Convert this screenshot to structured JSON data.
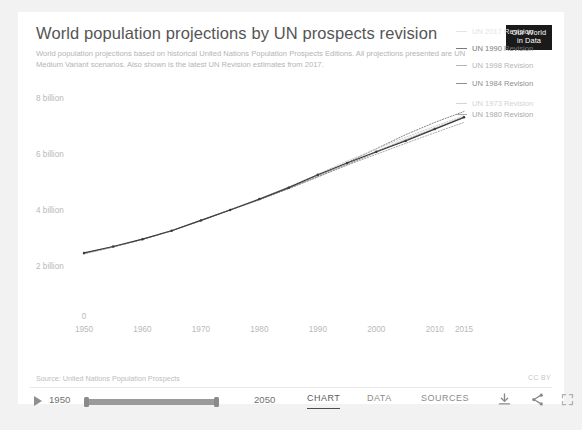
{
  "header": {
    "title": "World population projections by UN prospects revision",
    "subtitle": "World population projections based on historical United Nations Population Prospects Editions. All projections presented are UN Medium Variant scenarios. Also shown is the latest UN Revision estimates from 2017.",
    "logo_line1": "Our World",
    "logo_line2": "in Data"
  },
  "chart_data": {
    "type": "line",
    "title": "World population projections by UN prospects revision",
    "subtitle": "World population projections based on historical United Nations Population Prospects Editions. All projections presented are UN Medium Variant scenarios. Also shown is the latest UN Revision estimates from 2017.",
    "xlabel": "",
    "ylabel": "",
    "xlim": [
      1950,
      2015
    ],
    "ylim": [
      0,
      8
    ],
    "grid": false,
    "legend_position": "right",
    "y_ticks": [
      2,
      4,
      6,
      8
    ],
    "y_tick_labels": [
      "2 billion",
      "4 billion",
      "6 billion",
      "8 billion"
    ],
    "y_zero_label": "0",
    "x_ticks": [
      1950,
      1960,
      1970,
      1980,
      1990,
      2000,
      2010,
      2015
    ],
    "x_tick_labels": [
      "1950",
      "1960",
      "1970",
      "1980",
      "1990",
      "2000",
      "2010",
      "2015"
    ],
    "x": [
      1950,
      1955,
      1960,
      1965,
      1970,
      1975,
      1980,
      1985,
      1990,
      1995,
      2000,
      2005,
      2010,
      2015
    ],
    "series": [
      {
        "name": "UN 2017 Revision",
        "color": "#3c3c3c",
        "style": "solid",
        "values": [
          2.54,
          2.77,
          3.03,
          3.33,
          3.7,
          4.07,
          4.46,
          4.87,
          5.33,
          5.75,
          6.15,
          6.54,
          6.96,
          7.38
        ]
      },
      {
        "name": "UN 1990 Revision",
        "color": "#6f6f6f",
        "style": "dotted",
        "values": [
          2.52,
          2.76,
          3.02,
          3.34,
          3.7,
          4.08,
          4.45,
          4.85,
          5.29,
          5.76,
          6.26,
          6.76,
          7.2,
          7.59
        ]
      },
      {
        "name": "UN 1998 Revision",
        "color": "#9a9a9a",
        "style": "dotted",
        "values": [
          2.52,
          2.76,
          3.02,
          3.33,
          3.7,
          4.07,
          4.43,
          4.83,
          5.26,
          5.67,
          6.06,
          6.45,
          6.83,
          7.2
        ]
      },
      {
        "name": "UN 1984 Revision",
        "color": "#7c7c7c",
        "style": "dotted",
        "values": [
          2.51,
          2.75,
          3.02,
          3.33,
          3.69,
          4.07,
          4.45,
          4.84,
          5.25,
          5.69,
          6.13,
          6.56,
          6.98,
          7.38
        ]
      },
      {
        "name": "UN 1973 Revision",
        "color": "#c4c4c4",
        "style": "dotted",
        "values": [
          2.5,
          2.75,
          3.02,
          3.34,
          3.71,
          4.09,
          4.47,
          4.9,
          5.35,
          5.82,
          6.25,
          6.67,
          7.06,
          7.44
        ]
      },
      {
        "name": "UN 1980 Revision",
        "color": "#b0b0b0",
        "style": "dotted",
        "values": [
          2.51,
          2.75,
          3.02,
          3.33,
          3.7,
          4.08,
          4.45,
          4.85,
          5.28,
          5.72,
          6.17,
          6.6,
          7.0,
          7.4
        ]
      }
    ]
  },
  "legend": {
    "items": [
      {
        "label": "UN 2017 Revision",
        "color": "#e3e3e3"
      },
      {
        "label": "UN 1990 Revision",
        "color": "#7a7a7a"
      },
      {
        "label": "UN 1998 Revision",
        "color": "#b5b5b5"
      },
      {
        "label": "UN 1984 Revision",
        "color": "#8e8e8e"
      },
      {
        "label": "UN 1973 Revision",
        "color": "#d4d4d4"
      },
      {
        "label": "UN 1980 Revision",
        "color": "#a8a8a8"
      }
    ]
  },
  "source": {
    "text": "Source: United Nations Population Prospects",
    "license": "CC BY"
  },
  "controls": {
    "play_icon": "play-icon",
    "start_year": "1950",
    "end_year": "2050",
    "tabs": [
      {
        "id": "chart",
        "label": "CHART",
        "active": true
      },
      {
        "id": "data",
        "label": "DATA",
        "active": false
      },
      {
        "id": "sources",
        "label": "SOURCES",
        "active": false
      }
    ],
    "icons": [
      {
        "id": "download",
        "name": "download-icon"
      },
      {
        "id": "share",
        "name": "share-icon"
      },
      {
        "id": "fullscreen",
        "name": "fullscreen-icon"
      }
    ]
  },
  "colors": {
    "page_background": "#f2f2f2",
    "card_background": "#ffffff",
    "title_text": "#555555",
    "muted_text": "#b4b4b4",
    "accent_line": "#3c3c3c"
  }
}
